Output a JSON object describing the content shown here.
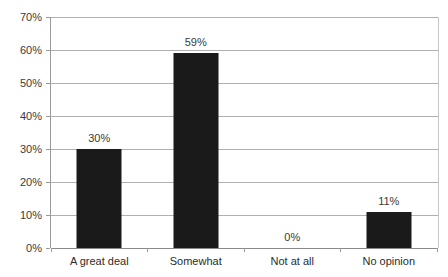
{
  "chart_data": {
    "type": "bar",
    "title": "",
    "subtitle": "",
    "xlabel": "",
    "ylabel": "",
    "categories": [
      "A great deal",
      "Somewhat",
      "Not at all",
      "No opinion"
    ],
    "values": [
      30,
      59,
      0,
      11
    ],
    "data_labels": [
      "30%",
      "59%",
      "0%",
      "11%"
    ],
    "ylim": [
      0,
      70
    ],
    "y_ticks": [
      0,
      10,
      20,
      30,
      40,
      50,
      60,
      70
    ],
    "y_tick_labels": [
      "0%",
      "10%",
      "20%",
      "30%",
      "40%",
      "50%",
      "60%",
      "70%"
    ],
    "grid": true,
    "legend": null,
    "series": [
      {
        "name": "",
        "values": [
          30,
          59,
          0,
          11
        ]
      }
    ],
    "colors": {
      "bar": "#1a1a1a",
      "gridline": "#b0b0b0",
      "axis": "#8a8a8a",
      "background": "#ffffff",
      "text": "#2b2b2b"
    }
  }
}
